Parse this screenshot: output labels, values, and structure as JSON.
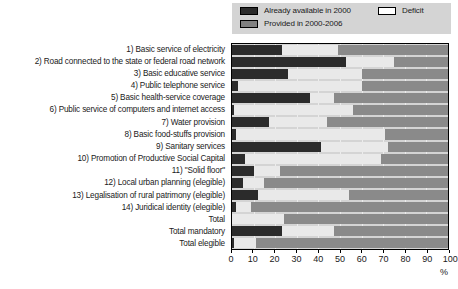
{
  "legend": {
    "items": [
      {
        "label": "Already available in 2000",
        "swatch": "avail",
        "color": "#2b2b2b"
      },
      {
        "label": "Provided in 2000-2006",
        "swatch": "provided",
        "color": "#808080"
      },
      {
        "label": "Deficit",
        "swatch": "deficit",
        "color": "#ffffff"
      }
    ]
  },
  "axis": {
    "x_title": "%",
    "ticks": [
      0,
      10,
      20,
      30,
      40,
      50,
      60,
      70,
      80,
      90,
      100
    ],
    "tick_labels": [
      "0",
      "10",
      "20",
      "30",
      "40",
      "50",
      "60",
      "70",
      "80",
      "90",
      "100"
    ],
    "xlim": [
      0,
      100
    ]
  },
  "chart_data": {
    "type": "bar",
    "orientation": "horizontal",
    "stacked": true,
    "title": "",
    "xlabel": "%",
    "ylabel": "",
    "xlim": [
      0,
      100
    ],
    "grid": true,
    "legend_position": "top-right",
    "categories": [
      "1) Basic service of electricity",
      "2) Road connected to the state or federal road network",
      "3) Basic educative service",
      "4) Public telephone service",
      "5) Basic health-service coverage",
      "6) Public service of computers and internet access",
      "7) Water provision",
      "8) Basic food-stuffs provision",
      "9) Sanitary services",
      "10) Promotion of Productive Social Capital",
      "11) \"Solid floor\"",
      "12) Local urban planning (elegible)",
      "13) Legalisation of rural patrimony (elegible)",
      "14) Juridical identity (elegible)",
      "Total",
      "Total mandatory",
      "Total elegible"
    ],
    "series": [
      {
        "name": "Already available in 2000",
        "color": "#2b2b2b",
        "values": [
          23,
          53,
          26,
          3,
          36,
          1,
          17,
          2,
          41,
          6,
          10,
          5,
          12,
          2,
          0,
          23,
          1
        ]
      },
      {
        "name": "Deficit",
        "color": "#e9e9e9",
        "values": [
          26,
          22,
          34,
          57,
          11,
          55,
          27,
          69,
          31,
          63,
          12,
          10,
          42,
          7,
          24,
          24,
          10
        ]
      },
      {
        "name": "Provided in 2000-2006",
        "color": "#8a8a8a",
        "values": [
          51,
          25,
          40,
          40,
          53,
          44,
          56,
          29,
          28,
          31,
          78,
          85,
          46,
          91,
          76,
          53,
          89
        ]
      }
    ]
  }
}
